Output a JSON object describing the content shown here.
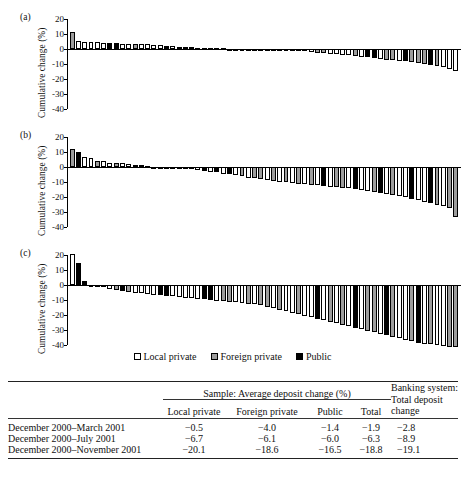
{
  "figure": {
    "panels": [
      {
        "label": "(a)",
        "ylabel": "Cumulative change (%)",
        "yticks": [
          "20",
          "10",
          "0",
          "-10",
          "-20",
          "-30",
          "-40"
        ]
      },
      {
        "label": "(b)",
        "ylabel": "Cumulative change (%)",
        "yticks": [
          "20",
          "10",
          "0",
          "-10",
          "-20",
          "-30",
          "-40"
        ]
      },
      {
        "label": "(c)",
        "ylabel": "Cumulative change (%)",
        "yticks": [
          "20",
          "10",
          "0",
          "-10",
          "-20",
          "-30",
          "-40"
        ]
      }
    ],
    "legend": [
      {
        "label": "Local private",
        "swatch": "local",
        "color": "#ffffff"
      },
      {
        "label": "Foreign private",
        "swatch": "foreign",
        "color": "#9d9d9d"
      },
      {
        "label": "Public",
        "swatch": "public",
        "color": "#000000"
      }
    ]
  },
  "chart_data": [
    {
      "type": "bar",
      "title": "(a) December 2000 - March 2001",
      "xlabel": "",
      "ylabel": "Cumulative change (%)",
      "ylim": [
        -40,
        20
      ],
      "yticks": [
        20,
        10,
        0,
        -10,
        -20,
        -30,
        -40
      ],
      "grid": false,
      "legend_position": "below-figure",
      "categories_note": "individual banks sorted by cumulative deposit change",
      "series": [
        {
          "name": "bank cumulative deposit change",
          "values": [
            11.3,
            5.5,
            5.0,
            4.6,
            4.4,
            4.3,
            4.0,
            3.9,
            3.6,
            3.5,
            3.4,
            3.2,
            3.1,
            3.0,
            2.6,
            2.0,
            1.8,
            1.6,
            1.5,
            1.2,
            1.0,
            0.8,
            0.6,
            0.5,
            0.4,
            0.3,
            0.2,
            0.1,
            0.0,
            -0.1,
            -0.2,
            -0.3,
            -0.4,
            -0.6,
            -0.8,
            -1.0,
            -1.3,
            -1.6,
            -2.0,
            -2.4,
            -2.8,
            -3.1,
            -3.4,
            -3.8,
            -4.2,
            -4.6,
            -5.2,
            -5.6,
            -6.0,
            -6.6,
            -7.0,
            -7.4,
            -7.8,
            -8.3,
            -8.8,
            -9.3,
            -9.8,
            -10.4,
            -11.0,
            -12.0,
            -13.0,
            -14.4
          ],
          "groups": [
            "foreign",
            "local",
            "local",
            "local",
            "local",
            "local",
            "public",
            "public",
            "local",
            "local",
            "foreign",
            "local",
            "local",
            "local",
            "local",
            "public",
            "local",
            "public",
            "local",
            "public",
            "local",
            "local",
            "local",
            "local",
            "local",
            "foreign",
            "local",
            "local",
            "local",
            "local",
            "local",
            "local",
            "local",
            "local",
            "local",
            "local",
            "local",
            "foreign",
            "local",
            "foreign",
            "foreign",
            "local",
            "local",
            "local",
            "local",
            "foreign",
            "local",
            "public",
            "public",
            "local",
            "foreign",
            "foreign",
            "local",
            "public",
            "foreign",
            "foreign",
            "foreign",
            "public",
            "foreign",
            "local",
            "local",
            "local"
          ]
        }
      ]
    },
    {
      "type": "bar",
      "title": "(b) December 2000 - July 2001",
      "xlabel": "",
      "ylabel": "Cumulative change (%)",
      "ylim": [
        -40,
        20
      ],
      "yticks": [
        20,
        10,
        0,
        -10,
        -20,
        -30,
        -40
      ],
      "grid": false,
      "legend_position": "below-figure",
      "series": [
        {
          "name": "bank cumulative deposit change",
          "values": [
            11.8,
            10.0,
            6.5,
            6.0,
            4.0,
            3.8,
            2.8,
            2.6,
            2.4,
            2.2,
            1.6,
            1.2,
            0.8,
            0.3,
            0.1,
            -0.2,
            -0.5,
            -0.8,
            -1.2,
            -1.6,
            -2.2,
            -2.6,
            -3.0,
            -3.6,
            -4.4,
            -4.8,
            -5.6,
            -6.2,
            -7.0,
            -7.6,
            -8.2,
            -8.8,
            -9.2,
            -9.8,
            -10.2,
            -10.6,
            -11.0,
            -11.4,
            -11.8,
            -12.2,
            -12.6,
            -13.0,
            -13.4,
            -13.8,
            -14.2,
            -14.8,
            -15.4,
            -16.0,
            -16.6,
            -17.2,
            -17.8,
            -18.4,
            -19.0,
            -20.0,
            -21.0,
            -22.0,
            -23.0,
            -24.0,
            -25.0,
            -26.0,
            -27.5,
            -33.5
          ],
          "groups": [
            "foreign",
            "public",
            "local",
            "local",
            "foreign",
            "local",
            "local",
            "foreign",
            "local",
            "local",
            "local",
            "local",
            "local",
            "local",
            "local",
            "local",
            "local",
            "local",
            "foreign",
            "local",
            "local",
            "public",
            "local",
            "public",
            "local",
            "public",
            "local",
            "foreign",
            "local",
            "foreign",
            "foreign",
            "local",
            "foreign",
            "local",
            "foreign",
            "local",
            "foreign",
            "local",
            "foreign",
            "local",
            "public",
            "local",
            "foreign",
            "foreign",
            "local",
            "public",
            "local",
            "local",
            "foreign",
            "public",
            "local",
            "foreign",
            "local",
            "local",
            "public",
            "local",
            "local",
            "public",
            "foreign",
            "local",
            "foreign",
            "foreign"
          ]
        }
      ]
    },
    {
      "type": "bar",
      "title": "(c) December 2000 - November 2001",
      "xlabel": "",
      "ylabel": "Cumulative change (%)",
      "ylim": [
        -40,
        20
      ],
      "yticks": [
        20,
        10,
        0,
        -10,
        -20,
        -30,
        -40
      ],
      "grid": false,
      "legend_position": "below-figure",
      "series": [
        {
          "name": "bank cumulative deposit change",
          "values": [
            21.0,
            14.5,
            2.5,
            -0.4,
            -1.2,
            -1.6,
            -2.6,
            -3.0,
            -4.2,
            -4.6,
            -5.0,
            -5.6,
            -6.0,
            -6.4,
            -6.8,
            -7.2,
            -7.6,
            -8.0,
            -8.4,
            -8.8,
            -9.2,
            -9.6,
            -10.0,
            -10.4,
            -10.8,
            -11.2,
            -11.6,
            -12.0,
            -12.4,
            -12.8,
            -13.2,
            -14.5,
            -15.5,
            -16.5,
            -17.5,
            -18.5,
            -19.5,
            -20.5,
            -21.5,
            -22.5,
            -23.5,
            -24.5,
            -25.5,
            -26.5,
            -27.5,
            -28.5,
            -29.5,
            -30.5,
            -31.5,
            -32.5,
            -33.5,
            -34.5,
            -35.5,
            -36.5,
            -37.5,
            -38.5,
            -39.0,
            -39.5,
            -40.0,
            -40.5,
            -41.0,
            -41.5
          ],
          "groups": [
            "local",
            "public",
            "public",
            "local",
            "local",
            "local",
            "local",
            "foreign",
            "public",
            "foreign",
            "local",
            "local",
            "local",
            "local",
            "public",
            "public",
            "local",
            "local",
            "local",
            "local",
            "local",
            "public",
            "public",
            "local",
            "foreign",
            "foreign",
            "local",
            "local",
            "foreign",
            "local",
            "foreign",
            "foreign",
            "local",
            "foreign",
            "local",
            "local",
            "foreign",
            "local",
            "local",
            "public",
            "local",
            "foreign",
            "local",
            "foreign",
            "local",
            "public",
            "local",
            "foreign",
            "foreign",
            "local",
            "public",
            "foreign",
            "local",
            "local",
            "foreign",
            "public",
            "local",
            "foreign",
            "local",
            "local",
            "foreign",
            "foreign"
          ]
        }
      ]
    }
  ],
  "table": {
    "group_header": "Sample: Average deposit change (%)",
    "right_header": "Banking system: Total deposit change",
    "right_header_l1": "Banking system:",
    "right_header_l2": "Total deposit",
    "right_header_l3": "change",
    "columns": [
      "Local private",
      "Foreign private",
      "Public",
      "Total"
    ],
    "col_local": "Local private",
    "col_foreign": "Foreign private",
    "col_public": "Public",
    "col_total": "Total",
    "rows": [
      {
        "period": "December 2000–March 2001",
        "local": "−0.5",
        "foreign": "−4.0",
        "public": "−1.4",
        "total": "−1.9",
        "system": "−2.8"
      },
      {
        "period": "December 2000–July 2001",
        "local": "−6.7",
        "foreign": "−6.1",
        "public": "−6.0",
        "total": "−6.3",
        "system": "−8.9"
      },
      {
        "period": "December 2000–November 2001",
        "local": "−20.1",
        "foreign": "−18.6",
        "public": "−16.5",
        "total": "−18.8",
        "system": "−19.1"
      }
    ]
  }
}
